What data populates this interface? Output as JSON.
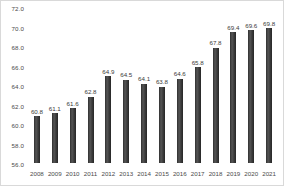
{
  "chart_data": {
    "type": "bar",
    "title": "",
    "subtitle": "",
    "xlabel": "",
    "ylabel": "",
    "categories": [
      "2008",
      "2009",
      "2010",
      "2011",
      "2012",
      "2013",
      "2014",
      "2015",
      "2016",
      "2017",
      "2018",
      "2019",
      "2020",
      "2021"
    ],
    "values": [
      60.8,
      61.1,
      61.6,
      62.8,
      64.9,
      64.5,
      64.1,
      63.8,
      64.6,
      65.8,
      67.8,
      69.4,
      69.6,
      69.8
    ],
    "value_labels": [
      "60.8",
      "61.1",
      "61.6",
      "62.8",
      "64.9",
      "64.5",
      "64.1",
      "63.8",
      "64.6",
      "65.8",
      "67.8",
      "69.4",
      "69.6",
      "69.8"
    ],
    "ylim": [
      56.0,
      72.0
    ],
    "ytick_labels": [
      "72.0",
      "70.0",
      "68.0",
      "66.0",
      "64.0",
      "62.0",
      "60.0",
      "58.0",
      "56.0"
    ],
    "ytick_values": [
      72.0,
      70.0,
      68.0,
      66.0,
      64.0,
      62.0,
      60.0,
      58.0,
      56.0
    ],
    "grid": false,
    "legend": "none",
    "bar_color": "#3a3a3a",
    "text_color": "#4a4a4a",
    "background_color": "#ffffff",
    "border_color": "#d9d9d9"
  }
}
